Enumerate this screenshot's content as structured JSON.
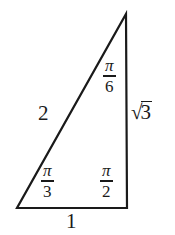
{
  "figure": {
    "name": "right-triangle-30-60-90",
    "background_color": "#ffffff",
    "stroke_color": "#1a1a1a",
    "text_color": "#1a1a1a"
  },
  "triangle": {
    "vertices": {
      "apex": [
        126,
        14
      ],
      "bottom_left": [
        17,
        208
      ],
      "bottom_right": [
        127,
        208
      ]
    },
    "stroke_width": 2.2
  },
  "sides": {
    "hypotenuse": {
      "label": "2",
      "position": "left-of-hypotenuse"
    },
    "vertical": {
      "label_sign": "√",
      "label_arg": "3",
      "label": "√3",
      "position": "right-of-vertical-leg"
    },
    "base": {
      "label": "1",
      "position": "below-base"
    }
  },
  "angles": {
    "top": {
      "numerator": "π",
      "denominator": "6",
      "label": "π/6"
    },
    "bottom_left": {
      "numerator": "π",
      "denominator": "3",
      "label": "π/3"
    },
    "bottom_right": {
      "numerator": "π",
      "denominator": "2",
      "label": "π/2"
    }
  }
}
